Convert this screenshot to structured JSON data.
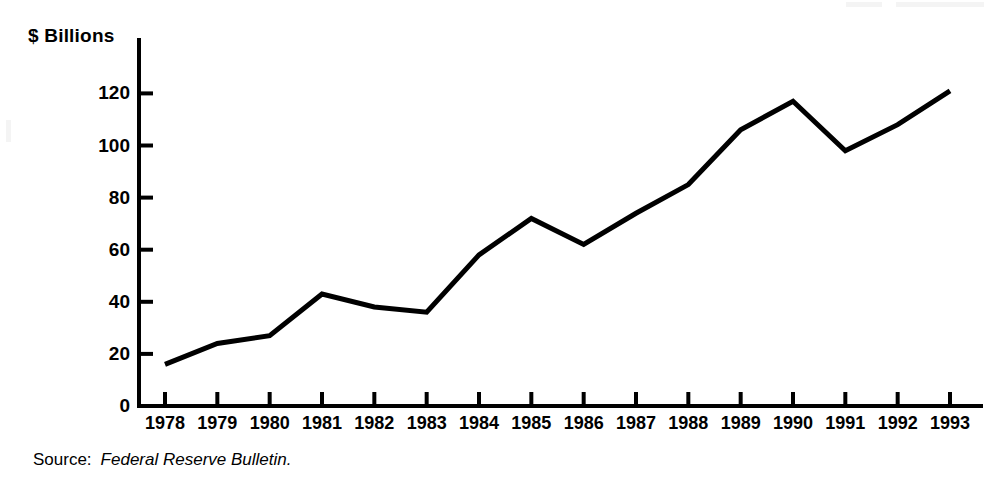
{
  "figure": {
    "y_axis_title": "$ Billions",
    "source": {
      "label": "Source:",
      "title": "Federal Reserve Bulletin."
    }
  },
  "chart_data": {
    "type": "line",
    "title": "",
    "subtitle": "",
    "xlabel": "",
    "ylabel": "$ Billions",
    "categories": [
      "1978",
      "1979",
      "1980",
      "1981",
      "1982",
      "1983",
      "1984",
      "1985",
      "1986",
      "1987",
      "1988",
      "1989",
      "1990",
      "1991",
      "1992",
      "1993"
    ],
    "x": [
      1978,
      1979,
      1980,
      1981,
      1982,
      1983,
      1984,
      1985,
      1986,
      1987,
      1988,
      1989,
      1990,
      1991,
      1992,
      1993
    ],
    "values": [
      16,
      24,
      27,
      43,
      38,
      36,
      58,
      72,
      62,
      74,
      85,
      106,
      117,
      98,
      108,
      121
    ],
    "series": [
      {
        "name": "",
        "values": [
          16,
          24,
          27,
          43,
          38,
          36,
          58,
          72,
          62,
          74,
          85,
          106,
          117,
          98,
          108,
          121
        ]
      }
    ],
    "ylim": [
      0,
      130
    ],
    "xlim": [
      1978,
      1993
    ],
    "yticks": [
      0,
      20,
      40,
      60,
      80,
      100,
      120
    ],
    "ytick_labels": [
      "0",
      "20",
      "40",
      "60",
      "80",
      "100",
      "120"
    ],
    "xticks": [
      1978,
      1979,
      1980,
      1981,
      1982,
      1983,
      1984,
      1985,
      1986,
      1987,
      1988,
      1989,
      1990,
      1991,
      1992,
      1993
    ],
    "xtick_labels": [
      "1978",
      "1979",
      "1980",
      "1981",
      "1982",
      "1983",
      "1984",
      "1985",
      "1986",
      "1987",
      "1988",
      "1989",
      "1990",
      "1991",
      "1992",
      "1993"
    ],
    "grid": false,
    "legend": false,
    "legend_position": "none",
    "line_color": "#000000",
    "line_width": 5,
    "background_color": "#ffffff",
    "axis_color": "#000000",
    "annotations": []
  }
}
